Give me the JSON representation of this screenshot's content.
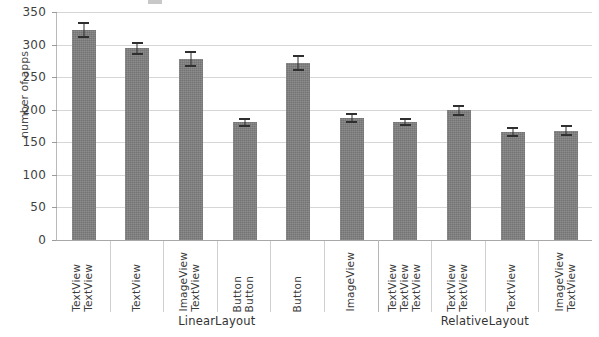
{
  "chart_data": {
    "type": "bar",
    "title": "",
    "xlabel": "",
    "ylabel": "number of apps",
    "ylim": [
      0,
      350
    ],
    "yticks": [
      0,
      50,
      100,
      150,
      200,
      250,
      300,
      350
    ],
    "grid": true,
    "legend": "none",
    "orientation": "vertical",
    "error_bars": "symmetric",
    "bar_color": "#7f7f7f",
    "categories": [
      "TextView TextView",
      "TextView",
      "ImageView TextView",
      "Button Button",
      "Button",
      "ImageView",
      "TextView TextView TextView",
      "TextView TextView",
      "TextView",
      "ImageView TextView"
    ],
    "category_words": [
      [
        "TextView",
        "TextView"
      ],
      [
        "TextView"
      ],
      [
        "ImageView",
        "TextView"
      ],
      [
        "Button",
        "Button"
      ],
      [
        "Button"
      ],
      [
        "ImageView"
      ],
      [
        "TextView",
        "TextView",
        "TextView"
      ],
      [
        "TextView",
        "TextView"
      ],
      [
        "TextView"
      ],
      [
        "ImageView",
        "TextView"
      ]
    ],
    "values": [
      322,
      294,
      278,
      181,
      272,
      187,
      181,
      199,
      166,
      168
    ],
    "errors": [
      12,
      10,
      12,
      7,
      12,
      8,
      6,
      9,
      8,
      9
    ],
    "groups": [
      {
        "label": "LinearLayout",
        "start_index": 0,
        "end_index": 6
      },
      {
        "label": "RelativeLayout",
        "start_index": 6,
        "end_index": 10
      }
    ]
  },
  "axis": {
    "y_title": "number of apps",
    "y_tick_labels": [
      "350",
      "300",
      "250",
      "200",
      "150",
      "100",
      "50",
      "0"
    ]
  }
}
